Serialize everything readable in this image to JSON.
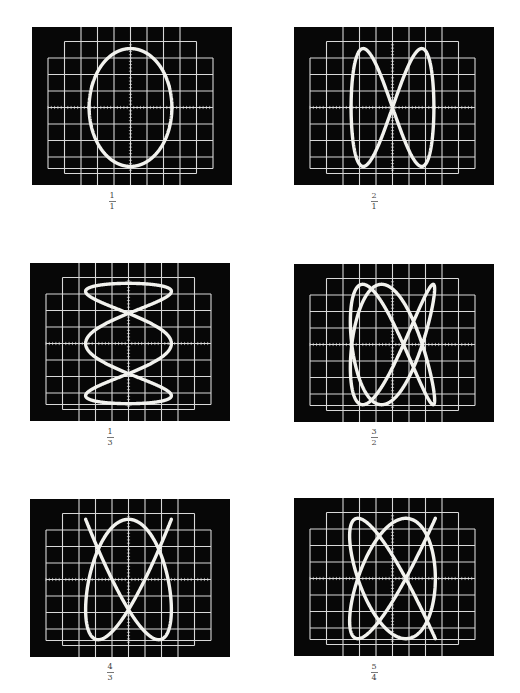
{
  "figure": {
    "colors": {
      "screen": "#070707",
      "grid": "#d8d8d8",
      "trace": "#f2f2ee",
      "background": "#ffffff"
    },
    "graticule": {
      "divisions_x": 10,
      "divisions_y": 8,
      "center_ticks": true
    },
    "panels": [
      {
        "id": "p1",
        "ratio_num": "1",
        "ratio_den": "1",
        "fx": 1,
        "fy": 1,
        "phase": 1.5708,
        "ax": 0.56,
        "ay": 0.94,
        "x": 32,
        "y": 27,
        "label_x": 112,
        "label_y": 192
      },
      {
        "id": "p2",
        "ratio_num": "2",
        "ratio_den": "1",
        "fx": 1,
        "fy": 2,
        "phase": 0,
        "ax": 0.56,
        "ay": 0.94,
        "x": 294,
        "y": 27,
        "label_x": 374,
        "label_y": 192
      },
      {
        "id": "p3",
        "ratio_num": "1",
        "ratio_den": "3",
        "fx": 3,
        "fy": 1,
        "phase": 1.5708,
        "ax": 0.58,
        "ay": 0.96,
        "x": 30,
        "y": 263,
        "label_x": 110,
        "label_y": 428
      },
      {
        "id": "p4",
        "ratio_num": "3",
        "ratio_den": "2",
        "fx": 2,
        "fy": 3,
        "phase": 0.7854,
        "ax": 0.57,
        "ay": 0.96,
        "x": 294,
        "y": 264,
        "label_x": 374,
        "label_y": 428
      },
      {
        "id": "p5",
        "ratio_num": "4",
        "ratio_den": "3",
        "fx": 3,
        "fy": 4,
        "phase": 0.3927,
        "ax": 0.58,
        "ay": 0.96,
        "x": 30,
        "y": 499,
        "label_x": 110,
        "label_y": 663
      },
      {
        "id": "p6",
        "ratio_num": "5",
        "ratio_den": "4",
        "fx": 4,
        "fy": 5,
        "phase": 0.3142,
        "ax": 0.58,
        "ay": 0.96,
        "x": 294,
        "y": 498,
        "label_x": 374,
        "label_y": 663
      }
    ]
  }
}
